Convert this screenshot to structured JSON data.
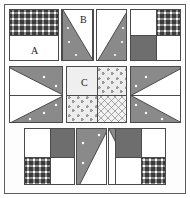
{
  "figure": {
    "background_color": "#ffffff",
    "frame_color": "#5d5d5d",
    "line_color": "#4a4a4a",
    "width": 190,
    "height": 198
  },
  "palette": {
    "white": "#ffffff",
    "solid_gray": "#6e6e6e",
    "dotted_gray": "#8a8a8a",
    "checker_dark": "#3a3a3a",
    "light_plain": "#efefef",
    "light_triangle": "#ededed",
    "light_lattice": "#f2f2f2",
    "outline": "#4a4a4a"
  },
  "labels": {
    "a": "A",
    "b": "B",
    "c": "C"
  },
  "blocks": [
    {
      "id": "top-left-corner",
      "name": "four-patch-corner-block",
      "row": "top",
      "column": "left",
      "patches": [
        {
          "position": "top",
          "fill": "checker"
        },
        {
          "position": "bottom",
          "fill": "white",
          "label": "A"
        }
      ]
    },
    {
      "id": "top-inner-left",
      "name": "half-square-bar-block",
      "row": "top",
      "column": "inner-left",
      "patches": [
        {
          "position": "top",
          "fill": "white"
        },
        {
          "position": "bottom",
          "fill": "solid_gray"
        }
      ]
    },
    {
      "id": "top-center-left",
      "name": "narrow-triangle-block-left",
      "row": "top",
      "column": "center-left",
      "patches": [
        {
          "position": "left-triangle",
          "fill": "dotted_gray",
          "label": "B"
        },
        {
          "position": "right-triangle",
          "fill": "white"
        }
      ]
    },
    {
      "id": "top-center-right",
      "name": "narrow-triangle-block-right",
      "row": "top",
      "column": "center-right",
      "patches": [
        {
          "position": "left-triangle",
          "fill": "white"
        },
        {
          "position": "right-triangle",
          "fill": "dotted_gray"
        }
      ]
    },
    {
      "id": "top-right-corner",
      "name": "four-patch-corner-block",
      "row": "top",
      "column": "right",
      "patches": [
        {
          "position": "top-left",
          "fill": "white"
        },
        {
          "position": "top-right",
          "fill": "checker"
        },
        {
          "position": "bottom-left",
          "fill": "solid_gray"
        },
        {
          "position": "bottom-right",
          "fill": "white"
        }
      ]
    },
    {
      "id": "middle-left",
      "name": "arrow-block-pointing-right",
      "row": "middle",
      "column": "left",
      "patches": [
        {
          "position": "upper",
          "fill": "dotted_gray"
        },
        {
          "position": "lower",
          "fill": "dotted_gray"
        },
        {
          "position": "wedge",
          "fill": "white"
        }
      ]
    },
    {
      "id": "center",
      "name": "center-four-patch-block",
      "row": "middle",
      "column": "center",
      "label": "C",
      "patches": [
        {
          "position": "top-left",
          "fill": "light_plain",
          "label": "C"
        },
        {
          "position": "top-right",
          "fill": "light_triangle"
        },
        {
          "position": "bottom-left",
          "fill": "light_triangle"
        },
        {
          "position": "bottom-right",
          "fill": "light_lattice"
        }
      ]
    },
    {
      "id": "middle-right",
      "name": "arrow-block-pointing-left",
      "row": "middle",
      "column": "right",
      "patches": [
        {
          "position": "upper",
          "fill": "dotted_gray"
        },
        {
          "position": "lower",
          "fill": "dotted_gray"
        },
        {
          "position": "wedge",
          "fill": "white"
        }
      ]
    },
    {
      "id": "bottom-left-corner",
      "name": "four-patch-corner-block",
      "row": "bottom",
      "column": "left",
      "patches": [
        {
          "position": "top-left",
          "fill": "white"
        },
        {
          "position": "top-right",
          "fill": "solid_gray"
        },
        {
          "position": "bottom-left",
          "fill": "checker"
        },
        {
          "position": "bottom-right",
          "fill": "white"
        }
      ]
    },
    {
      "id": "bottom-center-left",
      "name": "narrow-triangle-block-left",
      "row": "bottom",
      "column": "center-left",
      "patches": [
        {
          "position": "upper-left-triangle",
          "fill": "dotted_gray"
        },
        {
          "position": "lower-right-triangle",
          "fill": "white"
        }
      ]
    },
    {
      "id": "bottom-center-right",
      "name": "narrow-triangle-block-right",
      "row": "bottom",
      "column": "center-right",
      "patches": [
        {
          "position": "lower-left-triangle",
          "fill": "white"
        },
        {
          "position": "upper-right-triangle",
          "fill": "dotted_gray"
        }
      ]
    },
    {
      "id": "bottom-right-corner",
      "name": "four-patch-corner-block",
      "row": "bottom",
      "column": "right",
      "patches": [
        {
          "position": "top-left",
          "fill": "solid_gray"
        },
        {
          "position": "top-right",
          "fill": "white"
        },
        {
          "position": "bottom-left",
          "fill": "white"
        },
        {
          "position": "bottom-right",
          "fill": "checker"
        }
      ]
    }
  ]
}
